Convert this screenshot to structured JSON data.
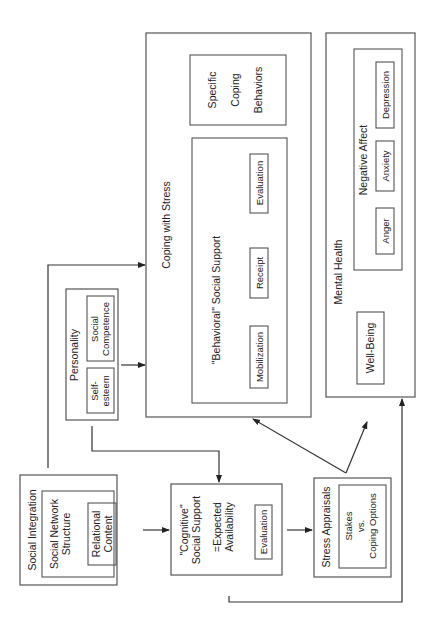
{
  "diagram": {
    "orientation": "rotated-90-ccw",
    "nodes": {
      "social_integration": {
        "title": "Social Integration",
        "inner_title_line1": "Social Network",
        "inner_title_line2": "Structure",
        "relational_line1": "Relational",
        "relational_line2": "Content"
      },
      "personality": {
        "title": "Personality",
        "self_esteem_line1": "Self-",
        "self_esteem_line2": "esteem",
        "competence_line1": "Social",
        "competence_line2": "Competence"
      },
      "cognitive_support": {
        "title_line1": "\"Cognitive\"",
        "title_line2": "Social Support",
        "expected_line1": "=Expected",
        "expected_line2": "Availability",
        "evaluation": "Evaluation"
      },
      "stress_appraisals": {
        "title": "Stress Appraisals",
        "stakes_line1": "Stakes",
        "stakes_line2": "vs.",
        "stakes_line3": "Coping Options"
      },
      "coping": {
        "title": "Coping with Stress",
        "specific_line1": "Specific",
        "specific_line2": "Coping",
        "specific_line3": "Behaviors",
        "behavioral_title": "\"Behavioral\" Social Support",
        "mobilization": "Mobilization",
        "receipt": "Receipt",
        "evaluation": "Evaluation"
      },
      "mental_health": {
        "title": "Mental Health",
        "well_being": "Well-Being",
        "negative_affect": "Negative Affect",
        "anger": "Anger",
        "anxiety": "Anxiety",
        "depression": "Depression"
      }
    },
    "edges": [
      {
        "from": "Social Integration",
        "to": "Coping with Stress"
      },
      {
        "from": "Social Integration",
        "to": "\"Cognitive\" Social Support"
      },
      {
        "from": "Personality",
        "to": "Coping with Stress"
      },
      {
        "from": "Personality",
        "to": "\"Cognitive\" Social Support"
      },
      {
        "from": "\"Cognitive\" Social Support",
        "to": "Stress Appraisals"
      },
      {
        "from": "\"Cognitive\" Social Support",
        "to": "Mental Health"
      },
      {
        "from": "Stress Appraisals",
        "to": "Coping with Stress"
      },
      {
        "from": "Stress Appraisals",
        "to": "Mental Health"
      }
    ]
  }
}
